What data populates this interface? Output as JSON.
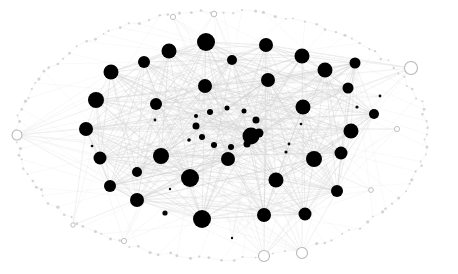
{
  "figure": {
    "title": "",
    "background_color": "#ffffff",
    "width": 458,
    "height": 274
  },
  "chart_data": {
    "type": "scatter",
    "title": "",
    "subtitle": "",
    "xlabel": "",
    "ylabel": "",
    "xlim": [
      0,
      458
    ],
    "ylim": [
      0,
      274
    ],
    "grid": false,
    "legend": null,
    "annotations": [],
    "style": {
      "hub_fill": "#000000",
      "inner_fill": "#000000",
      "tiny_fill": "#0a0a0a",
      "rim_stroke": "#b9b9b9",
      "rim_fill": "#ffffff",
      "rim_dot_fill": "#c8c8c8",
      "edge_core_color": "#cfcfcf",
      "edge_mid_color": "#dcdcdc",
      "edge_rim_color": "#e6e6e6"
    },
    "ticks": {
      "x": [],
      "y": []
    },
    "series": [
      {
        "name": "hub-nodes",
        "role": "high-degree core nodes",
        "marker": "filled-circle",
        "color": "#000000",
        "points": [
          {
            "id": "h1",
            "x": 206,
            "y": 42,
            "r": 9.0
          },
          {
            "id": "h2",
            "x": 266,
            "y": 45,
            "r": 7.0
          },
          {
            "id": "h3",
            "x": 302,
            "y": 56,
            "r": 7.5
          },
          {
            "id": "h4",
            "x": 325,
            "y": 70,
            "r": 7.5
          },
          {
            "id": "h5",
            "x": 169,
            "y": 51,
            "r": 7.5
          },
          {
            "id": "h6",
            "x": 232,
            "y": 60,
            "r": 5.0
          },
          {
            "id": "h7",
            "x": 144,
            "y": 62,
            "r": 6.0
          },
          {
            "id": "h8",
            "x": 111,
            "y": 72,
            "r": 7.5
          },
          {
            "id": "h9",
            "x": 268,
            "y": 80,
            "r": 7.0
          },
          {
            "id": "h10",
            "x": 205,
            "y": 86,
            "r": 7.0
          },
          {
            "id": "h11",
            "x": 348,
            "y": 88,
            "r": 5.5
          },
          {
            "id": "h12",
            "x": 96,
            "y": 100,
            "r": 8.0
          },
          {
            "id": "h13",
            "x": 156,
            "y": 104,
            "r": 6.0
          },
          {
            "id": "h14",
            "x": 303,
            "y": 107,
            "r": 7.5
          },
          {
            "id": "h15",
            "x": 86,
            "y": 129,
            "r": 7.0
          },
          {
            "id": "h16",
            "x": 351,
            "y": 131,
            "r": 7.5
          },
          {
            "id": "h17",
            "x": 100,
            "y": 158,
            "r": 6.5
          },
          {
            "id": "h18",
            "x": 137,
            "y": 172,
            "r": 5.0
          },
          {
            "id": "h19",
            "x": 161,
            "y": 156,
            "r": 8.0
          },
          {
            "id": "h20",
            "x": 190,
            "y": 178,
            "r": 9.0
          },
          {
            "id": "h21",
            "x": 228,
            "y": 159,
            "r": 7.0
          },
          {
            "id": "h22",
            "x": 251,
            "y": 136,
            "r": 8.5
          },
          {
            "id": "h23",
            "x": 276,
            "y": 180,
            "r": 7.5
          },
          {
            "id": "h24",
            "x": 314,
            "y": 159,
            "r": 8.0
          },
          {
            "id": "h25",
            "x": 341,
            "y": 153,
            "r": 6.5
          },
          {
            "id": "h26",
            "x": 337,
            "y": 191,
            "r": 6.0
          },
          {
            "id": "h27",
            "x": 305,
            "y": 214,
            "r": 6.5
          },
          {
            "id": "h28",
            "x": 264,
            "y": 215,
            "r": 7.0
          },
          {
            "id": "h29",
            "x": 202,
            "y": 219,
            "r": 9.0
          },
          {
            "id": "h30",
            "x": 137,
            "y": 200,
            "r": 7.0
          },
          {
            "id": "h31",
            "x": 110,
            "y": 186,
            "r": 6.0
          },
          {
            "id": "h32",
            "x": 374,
            "y": 114,
            "r": 5.0
          },
          {
            "id": "h33",
            "x": 355,
            "y": 63,
            "r": 5.5
          }
        ]
      },
      {
        "name": "inner-ring-nodes",
        "role": "central minor ring",
        "marker": "filled-circle",
        "color": "#000000",
        "points": [
          {
            "id": "c1",
            "x": 210,
            "y": 112,
            "r": 3.0
          },
          {
            "id": "c2",
            "x": 227,
            "y": 108,
            "r": 2.5
          },
          {
            "id": "c3",
            "x": 244,
            "y": 111,
            "r": 2.5
          },
          {
            "id": "c4",
            "x": 256,
            "y": 120,
            "r": 3.5
          },
          {
            "id": "c5",
            "x": 259,
            "y": 133,
            "r": 4.5
          },
          {
            "id": "c6",
            "x": 247,
            "y": 144,
            "r": 3.5
          },
          {
            "id": "c7",
            "x": 231,
            "y": 147,
            "r": 3.0
          },
          {
            "id": "c8",
            "x": 214,
            "y": 145,
            "r": 3.0
          },
          {
            "id": "c9",
            "x": 202,
            "y": 137,
            "r": 3.0
          },
          {
            "id": "c10",
            "x": 196,
            "y": 126,
            "r": 3.5
          },
          {
            "id": "c11",
            "x": 196,
            "y": 116,
            "r": 2.0
          },
          {
            "id": "c12",
            "x": 189,
            "y": 140,
            "r": 1.8
          }
        ]
      },
      {
        "name": "tiny-nodes",
        "role": "low-degree scattered nodes",
        "marker": "filled-circle",
        "color": "#0a0a0a",
        "points": [
          {
            "id": "t1",
            "x": 357,
            "y": 107,
            "r": 1.6
          },
          {
            "id": "t2",
            "x": 380,
            "y": 96,
            "r": 1.4
          },
          {
            "id": "t3",
            "x": 286,
            "y": 152,
            "r": 1.6
          },
          {
            "id": "t4",
            "x": 289,
            "y": 144,
            "r": 1.4
          },
          {
            "id": "t5",
            "x": 165,
            "y": 213,
            "r": 2.6
          },
          {
            "id": "t6",
            "x": 155,
            "y": 120,
            "r": 1.4
          },
          {
            "id": "t7",
            "x": 92,
            "y": 146,
            "r": 1.3
          },
          {
            "id": "t8",
            "x": 170,
            "y": 189,
            "r": 1.2
          },
          {
            "id": "t9",
            "x": 232,
            "y": 238,
            "r": 1.2
          },
          {
            "id": "t10",
            "x": 301,
            "y": 124,
            "r": 1.3
          }
        ]
      },
      {
        "name": "rim-nodes",
        "role": "perimeter hollow nodes",
        "marker": "open-circle",
        "color": "#b9b9b9",
        "points": [
          {
            "id": "r1",
            "x": 411,
            "y": 68,
            "r": 6.5
          },
          {
            "id": "r2",
            "x": 17,
            "y": 135,
            "r": 5.0
          },
          {
            "id": "r3",
            "x": 264,
            "y": 256,
            "r": 5.5
          },
          {
            "id": "r4",
            "x": 302,
            "y": 253,
            "r": 5.5
          },
          {
            "id": "r5",
            "x": 173,
            "y": 17,
            "r": 2.6
          },
          {
            "id": "r6",
            "x": 214,
            "y": 14,
            "r": 2.8
          },
          {
            "id": "r7",
            "x": 124,
            "y": 241,
            "r": 2.6
          },
          {
            "id": "r8",
            "x": 397,
            "y": 129,
            "r": 2.6
          },
          {
            "id": "r9",
            "x": 371,
            "y": 190,
            "r": 2.4
          },
          {
            "id": "r10",
            "x": 73,
            "y": 225,
            "r": 2.2
          }
        ]
      }
    ]
  }
}
